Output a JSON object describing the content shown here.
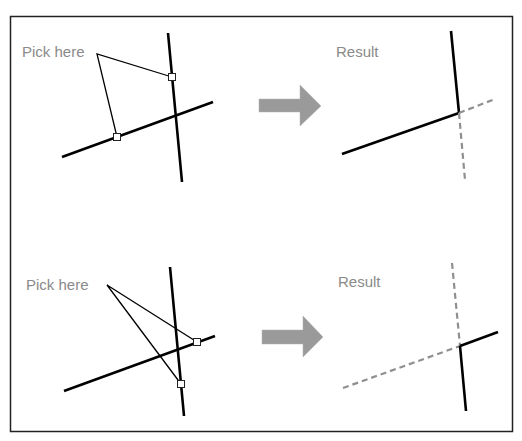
{
  "panels": {
    "top": {
      "pick_label": "Pick here",
      "result_label": "Result"
    },
    "bottom": {
      "pick_label": "Pick here",
      "result_label": "Result"
    }
  },
  "icons": {
    "arrow": "right-arrow-icon",
    "pick_box": "pick-point-square"
  },
  "colors": {
    "frame": "#222222",
    "line": "#000000",
    "dashed_line": "#8f8f8f",
    "label": "#8a8a8a",
    "arrow": "#9a9a9a"
  }
}
